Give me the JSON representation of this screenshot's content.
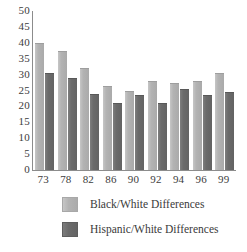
{
  "chart_data": {
    "type": "bar",
    "title": "",
    "subtitle": "",
    "xlabel": "",
    "ylabel": "",
    "categories": [
      "73",
      "78",
      "82",
      "86",
      "90",
      "92",
      "94",
      "96",
      "99"
    ],
    "series": [
      {
        "name": "Black/White Differences",
        "color": "#b3b3b3",
        "values": [
          40,
          37.5,
          32,
          26.5,
          25,
          28,
          27.5,
          28,
          30.5
        ]
      },
      {
        "name": "Hispanic/White Differences",
        "color": "#6b6b6b",
        "values": [
          30.5,
          29,
          24,
          21,
          23.5,
          21,
          25.5,
          23.5,
          24.5
        ]
      }
    ],
    "ylim": [
      0,
      50
    ],
    "ytick_labels": [
      "50",
      "45",
      "40",
      "35",
      "30",
      "25",
      "20",
      "15",
      "10",
      "5",
      "0"
    ],
    "ytick_values": [
      50,
      45,
      40,
      35,
      30,
      25,
      20,
      15,
      10,
      5,
      0
    ],
    "grid": false,
    "legend_position": "bottom-left"
  },
  "legend": {
    "items": [
      {
        "label": "Black/White Differences",
        "swatch": "light-gray-swatch"
      },
      {
        "label": "Hispanic/White Differences",
        "swatch": "dark-gray-swatch"
      }
    ]
  },
  "colors": {
    "series_light": "#b3b3b3",
    "series_dark": "#6b6b6b",
    "axis": "#8c8c8c",
    "text": "#3a3a3a",
    "background": "#ffffff"
  }
}
